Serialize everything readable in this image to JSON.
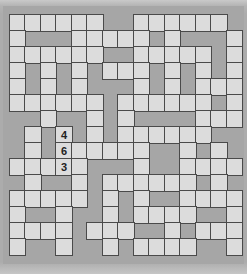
{
  "puzzle": {
    "type": "crossword",
    "rows": 15,
    "cols": 15,
    "grid": [
      "WWWWWWBBWWWWWWB",
      "WBBBWWWWWBWBBBW",
      "WWWWWWBBWWWWWBW",
      "WBWBWBWWWBWBWBW",
      "WBWBWBBBWBWBWWW",
      "WWWWWWBWWWWWWBW",
      "BBWBBWBWBBBBWWW",
      "BWBWBWBWWWWWWBB",
      "BWBWWWWWWBBWBWB",
      "WWWWWBBBWBBWWWW",
      "BWBBWBWWWWWWBWB",
      "WWWWWBWBWBBWWWW",
      "WBBWBBWBWWWWBBW",
      "WWWWBWWWBBWBWWW",
      "WBBWBBWBWWWWBBW"
    ],
    "filled": [
      {
        "row": 7,
        "col": 3,
        "value": "4"
      },
      {
        "row": 8,
        "col": 3,
        "value": "6"
      },
      {
        "row": 9,
        "col": 3,
        "value": "3"
      }
    ]
  },
  "colors": {
    "white_cell": "#dcdcdc",
    "black_cell": "#a6a6a6",
    "grid_line": "#4a4a4a",
    "digit": "#222222"
  }
}
